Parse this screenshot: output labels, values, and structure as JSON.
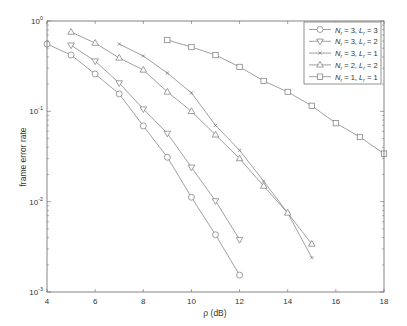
{
  "chart_data": {
    "type": "line",
    "title": "",
    "xlabel": "ρ (dB)",
    "ylabel": "frame error rate",
    "xscale": "linear",
    "yscale": "log",
    "xlim": [
      4,
      18
    ],
    "ylim": [
      0.001,
      1
    ],
    "x_ticks": [
      4,
      6,
      8,
      10,
      12,
      14,
      16,
      18
    ],
    "y_ticks": [
      {
        "value": 1,
        "base": "10",
        "exp": "0"
      },
      {
        "value": 0.1,
        "base": "10",
        "exp": "-1"
      },
      {
        "value": 0.01,
        "base": "10",
        "exp": "-2"
      },
      {
        "value": 0.001,
        "base": "10",
        "exp": "-3"
      }
    ],
    "grid": false,
    "legend_position": "upper right",
    "series": [
      {
        "name": "N_r = 3, L_r = 3",
        "label_N": "3",
        "label_L": "3",
        "marker": "circle",
        "x": [
          4,
          5,
          6,
          7,
          8,
          9,
          10,
          11,
          12
        ],
        "values": [
          0.556,
          0.42,
          0.259,
          0.156,
          0.069,
          0.031,
          0.0112,
          0.0043,
          0.00154
        ]
      },
      {
        "name": "N_r = 3, L_r = 2",
        "label_N": "3",
        "label_L": "2",
        "marker": "triangle-down",
        "x": [
          5,
          6,
          7,
          8,
          9,
          10,
          11,
          12
        ],
        "values": [
          0.54,
          0.36,
          0.206,
          0.106,
          0.057,
          0.024,
          0.0102,
          0.0038
        ]
      },
      {
        "name": "N_r = 3, L_r = 1",
        "label_N": "3",
        "label_L": "1",
        "marker": "cross",
        "x": [
          7,
          8,
          9,
          10,
          11,
          12,
          13,
          14,
          15
        ],
        "values": [
          0.556,
          0.41,
          0.265,
          0.16,
          0.07,
          0.037,
          0.0169,
          0.0075,
          0.0024
        ]
      },
      {
        "name": "N_r = 2, L_r = 2",
        "label_N": "2",
        "label_L": "2",
        "marker": "triangle-up",
        "x": [
          5,
          6,
          7,
          8,
          9,
          10,
          11,
          12,
          13,
          14,
          15
        ],
        "values": [
          0.755,
          0.57,
          0.39,
          0.287,
          0.164,
          0.1,
          0.055,
          0.03,
          0.0149,
          0.0075,
          0.0034
        ]
      },
      {
        "name": "N_r = 1, L_r = 1",
        "label_N": "1",
        "label_L": "1",
        "marker": "square",
        "x": [
          9,
          10,
          11,
          12,
          13,
          14,
          15,
          16,
          17,
          18
        ],
        "values": [
          0.616,
          0.515,
          0.42,
          0.31,
          0.217,
          0.164,
          0.115,
          0.074,
          0.052,
          0.034
        ]
      }
    ]
  },
  "style": {
    "line_color": "#777777",
    "axis_color": "#666666",
    "text_color": "#333333",
    "background": "#ffffff"
  }
}
